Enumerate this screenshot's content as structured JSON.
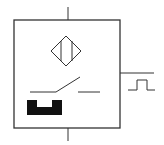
{
  "diagram": {
    "stroke_color": "#333333",
    "fill_color": "#111111",
    "background": "#ffffff",
    "elements": [
      {
        "name": "sensor-housing",
        "type": "rect"
      },
      {
        "name": "inductive-coil-icon",
        "type": "diamond"
      },
      {
        "name": "normally-open-contact",
        "type": "switch"
      },
      {
        "name": "target-actuator",
        "type": "block"
      },
      {
        "name": "pulse-output-icon",
        "type": "square-pulse"
      },
      {
        "name": "supply-lead-top",
        "type": "line"
      },
      {
        "name": "supply-lead-bottom",
        "type": "line"
      },
      {
        "name": "output-lead",
        "type": "line"
      }
    ]
  }
}
